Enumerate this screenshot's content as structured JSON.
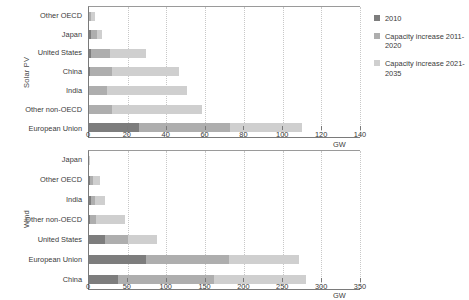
{
  "legend": {
    "position": "right",
    "items": [
      {
        "label": "2010",
        "color": "#7d7d7d",
        "key": "s2010",
        "icon": "legend-swatch-icon"
      },
      {
        "label": "Capacity increase 2011-2020",
        "color": "#aeaeae",
        "key": "s1120",
        "icon": "legend-swatch-icon"
      },
      {
        "label": "Capacity increase 2021-2035",
        "color": "#cfcfcf",
        "key": "s2135",
        "icon": "legend-swatch-icon"
      }
    ]
  },
  "chart_data": [
    {
      "type": "bar",
      "orientation": "horizontal",
      "stacked": true,
      "id": "solar-pv",
      "title": "",
      "ylabel": "Solar PV",
      "xlabel": "GW",
      "xlim": [
        0,
        140
      ],
      "xticks": [
        0,
        20,
        40,
        60,
        80,
        100,
        120,
        140
      ],
      "grid": true,
      "legend_position": "right",
      "categories": [
        "Other OECD",
        "Japan",
        "United States",
        "China",
        "India",
        "Other non-OECD",
        "European Union"
      ],
      "series": [
        {
          "name": "2010",
          "color": "#7d7d7d",
          "values": [
            1,
            3.5,
            2,
            0.8,
            0.1,
            0.3,
            29
          ]
        },
        {
          "name": "Capacity increase 2011-2020",
          "color": "#aeaeae",
          "values": [
            6,
            14.5,
            22,
            20,
            15,
            18,
            53
          ]
        },
        {
          "name": "Capacity increase 2021-2035",
          "color": "#cfcfcf",
          "values": [
            14,
            13,
            40,
            60,
            69,
            72,
            42
          ]
        }
      ],
      "totals": [
        21,
        31,
        64,
        81,
        84,
        90,
        124
      ]
    },
    {
      "type": "bar",
      "orientation": "horizontal",
      "stacked": true,
      "id": "wind",
      "title": "",
      "ylabel": "Wind",
      "xlabel": "GW",
      "xlim": [
        0,
        350
      ],
      "xticks": [
        0,
        50,
        100,
        150,
        200,
        250,
        300,
        350
      ],
      "grid": true,
      "legend_position": "right",
      "categories": [
        "Japan",
        "Other OECD",
        "India",
        "Other non-OECD",
        "United States",
        "European Union",
        "China"
      ],
      "series": [
        {
          "name": "2010",
          "color": "#7d7d7d",
          "values": [
            2,
            7,
            13,
            3,
            40,
            84,
            42
          ]
        },
        {
          "name": "Capacity increase 2011-2020",
          "color": "#aeaeae",
          "values": [
            6,
            20,
            20,
            22,
            61,
            121,
            138
          ]
        },
        {
          "name": "Capacity increase 2021-2035",
          "color": "#cfcfcf",
          "values": [
            12,
            44,
            52,
            103,
            75,
            103,
            133
          ]
        }
      ],
      "totals": [
        20,
        71,
        85,
        128,
        176,
        308,
        313
      ]
    }
  ]
}
